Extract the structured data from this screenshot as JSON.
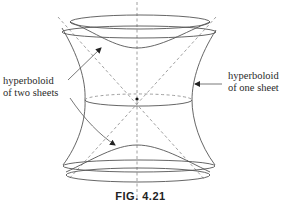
{
  "figure": {
    "caption": "FIG. 4.21",
    "labels": {
      "two_sheets": [
        "hyperboloid",
        "of two sheets"
      ],
      "one_sheet": [
        "hyperboloid",
        "of one sheet"
      ]
    },
    "colors": {
      "stroke": "#555555",
      "dashed": "#888888",
      "text": "#2a2a2a",
      "background": "#ffffff"
    }
  }
}
